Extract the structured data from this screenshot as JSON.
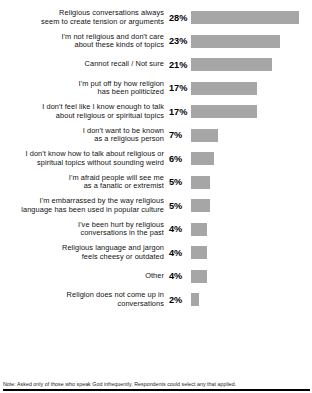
{
  "chart_data": {
    "type": "bar",
    "orientation": "horizontal",
    "title": "",
    "xlabel": "",
    "ylabel": "",
    "xlim": [
      0,
      30
    ],
    "grid": false,
    "legend": null,
    "value_suffix": "%",
    "bar_color": "#a6a6a6",
    "px_per_unit": 3.86,
    "categories": [
      "Religious conversations always seem to create tension or arguments",
      "I'm not religious and don't care about these kinds of topics",
      "Cannot recall / Not sure",
      "I'm put off by how religion has been politicized",
      "I don't feel like I know enough to talk about religious or spiritual topics",
      "I don't want to be known as a religious person",
      "I don't know how to talk about religious or spiritual topics without sounding weird",
      "I'm afraid people will see me as a fanatic or extremist",
      "I'm embarrassed by the way religious language has been used in popular culture",
      "I've been hurt by religious conversations in the past",
      "Religious language and jargon feels cheesy or outdated",
      "Other",
      "Religion does not come up in conversations"
    ],
    "values": [
      28,
      23,
      21,
      17,
      17,
      7,
      6,
      5,
      5,
      4,
      4,
      4,
      2
    ],
    "value_labels": [
      "28%",
      "23%",
      "21%",
      "17%",
      "17%",
      "7%",
      "6%",
      "5%",
      "5%",
      "4%",
      "4%",
      "4%",
      "2%"
    ],
    "note": "Note: Asked only of those who speak God infrequently. Respondents could select any that applied."
  },
  "rows": [
    {
      "label_line1": "Religious conversations always",
      "label_line2": "seem to create tension or arguments",
      "value": "28%",
      "bar_px": 108
    },
    {
      "label_line1": "I'm not religious and don't care",
      "label_line2": "about these kinds of topics",
      "value": "23%",
      "bar_px": 89
    },
    {
      "label_line1": "Cannot recall / Not sure",
      "label_line2": "",
      "value": "21%",
      "bar_px": 81
    },
    {
      "label_line1": "I'm put off by how religion",
      "label_line2": "has been politicized",
      "value": "17%",
      "bar_px": 66
    },
    {
      "label_line1": "I don't feel like I know enough to talk",
      "label_line2": "about religious or spiritual topics",
      "value": "17%",
      "bar_px": 66
    },
    {
      "label_line1": "I don't want to be known",
      "label_line2": "as a religious person",
      "value": "7%",
      "bar_px": 27
    },
    {
      "label_line1": "I don't know how to talk about religious or",
      "label_line2": "spiritual topics without sounding weird",
      "value": "6%",
      "bar_px": 23
    },
    {
      "label_line1": "I'm afraid people will see me",
      "label_line2": "as a fanatic or extremist",
      "value": "5%",
      "bar_px": 19
    },
    {
      "label_line1": "I'm embarrassed by the way religious",
      "label_line2": "language has been used in popular culture",
      "value": "5%",
      "bar_px": 19
    },
    {
      "label_line1": "I've been hurt by religious",
      "label_line2": "conversations in the past",
      "value": "4%",
      "bar_px": 16
    },
    {
      "label_line1": "Religious language and jargon",
      "label_line2": "feels cheesy or outdated",
      "value": "4%",
      "bar_px": 16
    },
    {
      "label_line1": "Other",
      "label_line2": "",
      "value": "4%",
      "bar_px": 16
    },
    {
      "label_line1": "Religion does not come up in",
      "label_line2": "conversations",
      "value": "2%",
      "bar_px": 8
    }
  ],
  "footer": {
    "note": "Note: Asked only of those who speak God infrequently. Respondents could select any that applied."
  }
}
